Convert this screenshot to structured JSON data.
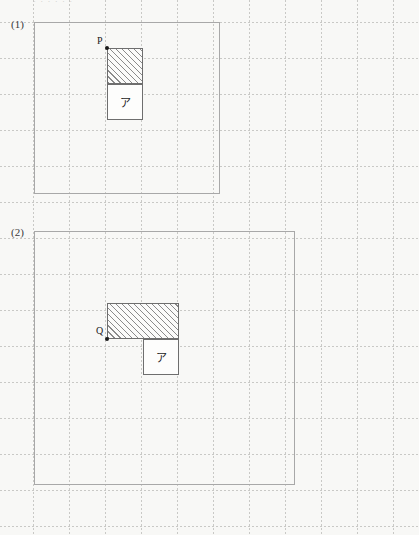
{
  "page": {
    "width": 419,
    "height": 535,
    "background_color": "#f8f8f6",
    "top_text_fragment": "· · · · · ·",
    "grid": {
      "spacing_px": 36,
      "origin_x": 33,
      "origin_y": 22,
      "style": "dotted",
      "color": "#c9c9c6"
    }
  },
  "problems": [
    {
      "id": "problem-1",
      "label": "(1)",
      "frame": {
        "x": 34,
        "y": 22,
        "width": 186,
        "height": 172
      },
      "shapes": [
        {
          "name": "hatched-square",
          "fill": "hatched",
          "x": 107,
          "y": 48,
          "width": 36,
          "height": 36,
          "label": ""
        },
        {
          "name": "region-a-square",
          "fill": "plain",
          "x": 107,
          "y": 84,
          "width": 36,
          "height": 36,
          "label": "ア"
        }
      ],
      "points": [
        {
          "name": "point-p",
          "label": "P",
          "x": 107,
          "y": 48,
          "label_dx": -10,
          "label_dy": -12
        }
      ]
    },
    {
      "id": "problem-2",
      "label": "(2)",
      "frame": {
        "x": 34,
        "y": 231,
        "width": 261,
        "height": 254
      },
      "shapes": [
        {
          "name": "hatched-rectangle",
          "fill": "hatched",
          "x": 107,
          "y": 303,
          "width": 72,
          "height": 36,
          "label": ""
        },
        {
          "name": "region-a-square",
          "fill": "plain",
          "x": 143,
          "y": 339,
          "width": 36,
          "height": 36,
          "label": "ア"
        }
      ],
      "points": [
        {
          "name": "point-q",
          "label": "Q",
          "x": 107,
          "y": 339,
          "label_dx": -11,
          "label_dy": -13
        }
      ]
    }
  ],
  "colors": {
    "paper": "#f8f8f6",
    "grid_line": "#c9c9c6",
    "frame_border": "#a8a8a8",
    "shape_border": "#6e6e6e",
    "hatch_line": "#8a8a8a",
    "ink": "#1a1a1a"
  }
}
